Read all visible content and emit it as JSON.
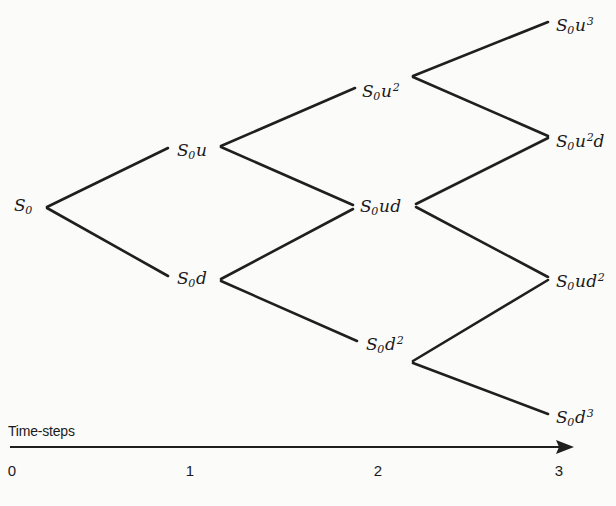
{
  "figure": {
    "type": "binomial-tree-diagram",
    "background_color": "#fbfbfa",
    "line_color": "#1f1f1f",
    "text_color": "#1a1a1a"
  },
  "nodes": [
    {
      "id": "n0",
      "step": 0,
      "base": "S",
      "sub": "0",
      "factor": "",
      "exp": "",
      "x": 14,
      "y": 207
    },
    {
      "id": "n1u",
      "step": 1,
      "base": "S",
      "sub": "0",
      "factor": "u",
      "exp": "",
      "x": 177,
      "y": 152
    },
    {
      "id": "n1d",
      "step": 1,
      "base": "S",
      "sub": "0",
      "factor": "d",
      "exp": "",
      "x": 177,
      "y": 280
    },
    {
      "id": "n2uu",
      "step": 2,
      "base": "S",
      "sub": "0",
      "factor": "u",
      "exp": "2",
      "x": 362,
      "y": 93
    },
    {
      "id": "n2ud",
      "step": 2,
      "base": "S",
      "sub": "0",
      "factor": "ud",
      "exp": "",
      "x": 360,
      "y": 208
    },
    {
      "id": "n2dd",
      "step": 2,
      "base": "S",
      "sub": "0",
      "factor": "d",
      "exp": "2",
      "x": 366,
      "y": 346
    },
    {
      "id": "n3uuu",
      "step": 3,
      "base": "S",
      "sub": "0",
      "factor": "u",
      "exp": "3",
      "x": 556,
      "y": 27
    },
    {
      "id": "n3uud",
      "step": 3,
      "base": "S",
      "sub": "0",
      "factor": "u",
      "exp": "2",
      "tail": "d",
      "x": 556,
      "y": 143
    },
    {
      "id": "n3udd",
      "step": 3,
      "base": "S",
      "sub": "0",
      "factor": "ud",
      "exp": "2",
      "x": 556,
      "y": 283
    },
    {
      "id": "n3ddd",
      "step": 3,
      "base": "S",
      "sub": "0",
      "factor": "d",
      "exp": "3",
      "x": 556,
      "y": 419
    }
  ],
  "edges": [
    {
      "from": "n0",
      "to": "n1u",
      "x1": 47,
      "y1": 207,
      "x2": 168,
      "y2": 148
    },
    {
      "from": "n0",
      "to": "n1d",
      "x1": 47,
      "y1": 208,
      "x2": 168,
      "y2": 276
    },
    {
      "from": "n1u",
      "to": "n2uu",
      "x1": 221,
      "y1": 146,
      "x2": 355,
      "y2": 88
    },
    {
      "from": "n1u",
      "to": "n2ud",
      "x1": 221,
      "y1": 147,
      "x2": 353,
      "y2": 205
    },
    {
      "from": "n1d",
      "to": "n2ud",
      "x1": 221,
      "y1": 279,
      "x2": 353,
      "y2": 209
    },
    {
      "from": "n1d",
      "to": "n2dd",
      "x1": 221,
      "y1": 281,
      "x2": 357,
      "y2": 341
    },
    {
      "from": "n2uu",
      "to": "n3uuu",
      "x1": 413,
      "y1": 76,
      "x2": 548,
      "y2": 22
    },
    {
      "from": "n2uu",
      "to": "n3uud",
      "x1": 413,
      "y1": 77,
      "x2": 548,
      "y2": 136
    },
    {
      "from": "n2ud",
      "to": "n3uud",
      "x1": 416,
      "y1": 204,
      "x2": 548,
      "y2": 138
    },
    {
      "from": "n2ud",
      "to": "n3udd",
      "x1": 416,
      "y1": 207,
      "x2": 548,
      "y2": 277
    },
    {
      "from": "n2dd",
      "to": "n3udd",
      "x1": 413,
      "y1": 361,
      "x2": 548,
      "y2": 280
    },
    {
      "from": "n2dd",
      "to": "n3ddd",
      "x1": 413,
      "y1": 363,
      "x2": 548,
      "y2": 414
    }
  ],
  "axis": {
    "title": "Time-steps",
    "title_x": 8,
    "title_y": 423,
    "line_y": 447,
    "line_x1": 10,
    "line_x2": 574,
    "ticks": [
      {
        "label": "0",
        "x": 12
      },
      {
        "label": "1",
        "x": 190
      },
      {
        "label": "2",
        "x": 378
      },
      {
        "label": "3",
        "x": 559
      }
    ],
    "tick_label_y": 462
  }
}
